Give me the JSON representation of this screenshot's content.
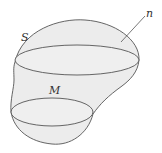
{
  "figure": {
    "labels": {
      "surface": "S",
      "normal": "n",
      "section": "M"
    },
    "colors": {
      "fill": "#ececec",
      "stroke": "#555555",
      "background": "#ffffff"
    }
  }
}
